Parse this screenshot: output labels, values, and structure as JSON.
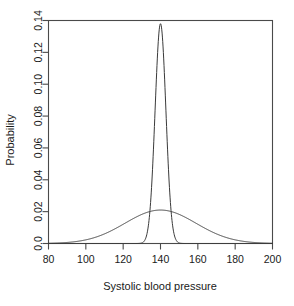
{
  "chart_data": {
    "type": "line",
    "title": "",
    "xlabel": "Systolic blood pressure",
    "ylabel": "Probability",
    "xlim": [
      80,
      200
    ],
    "ylim": [
      0.0,
      0.14
    ],
    "grid": false,
    "legend": "none",
    "xticks": [
      "80",
      "100",
      "120",
      "140",
      "160",
      "180",
      "200"
    ],
    "xtick_values": [
      80,
      100,
      120,
      140,
      160,
      180,
      200
    ],
    "yticks": [
      "0.0",
      "0.02",
      "0.04",
      "0.06",
      "0.08",
      "0.10",
      "0.12",
      "0.14"
    ],
    "ytick_values": [
      0.0,
      0.02,
      0.04,
      0.06,
      0.08,
      0.1,
      0.12,
      0.14
    ],
    "series": [
      {
        "name": "narrow-normal",
        "description": "Sharp peaked normal density centred at 140",
        "mean": 140,
        "sd": 2.9,
        "peak_x": 140,
        "peak_y": 0.138,
        "x": [
          80,
          90,
          100,
          110,
          120,
          125,
          130,
          132,
          134,
          135,
          136,
          137,
          138,
          139,
          140,
          141,
          142,
          143,
          144,
          145,
          146,
          148,
          150,
          155,
          160,
          170,
          180,
          190,
          200
        ],
        "values": [
          0.0,
          0.0,
          0.0,
          0.0,
          0.0,
          0.0,
          0.0003,
          0.0016,
          0.0078,
          0.0158,
          0.028,
          0.0448,
          0.0634,
          0.0793,
          0.1376,
          0.0793,
          0.0634,
          0.0448,
          0.028,
          0.0158,
          0.0078,
          0.0016,
          0.0003,
          0.0,
          0.0,
          0.0,
          0.0,
          0.0,
          0.0
        ]
      },
      {
        "name": "wide-normal",
        "description": "Broad normal density centred at 140",
        "mean": 140,
        "sd": 19.0,
        "peak_x": 140,
        "peak_y": 0.021,
        "x": [
          80,
          85,
          90,
          95,
          100,
          105,
          110,
          115,
          120,
          125,
          130,
          135,
          140,
          145,
          150,
          155,
          160,
          165,
          170,
          175,
          180,
          185,
          190,
          195,
          200
        ],
        "values": [
          0.0009,
          0.0017,
          0.003,
          0.005,
          0.0077,
          0.011,
          0.0146,
          0.0177,
          0.0198,
          0.0209,
          0.021,
          0.0208,
          0.021,
          0.0208,
          0.021,
          0.0209,
          0.0198,
          0.0177,
          0.0146,
          0.011,
          0.0077,
          0.005,
          0.003,
          0.0017,
          0.0009
        ]
      }
    ]
  },
  "figure": {
    "x_axis_title": "Systolic blood pressure",
    "y_axis_title": "Probability",
    "xticks": [
      "80",
      "100",
      "120",
      "140",
      "160",
      "180",
      "200"
    ],
    "yticks": [
      "0.0",
      "0.02",
      "0.04",
      "0.06",
      "0.08",
      "0.10",
      "0.12",
      "0.14"
    ],
    "colors": {
      "background": "#ffffff",
      "axis": "#4a4a4a",
      "curve": "#3a3a3a",
      "text": "#1a1a1a"
    }
  }
}
